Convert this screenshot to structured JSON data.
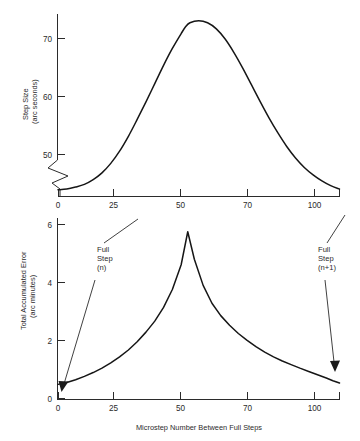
{
  "figure": {
    "background_color": "#ffffff",
    "line_color": "#161616",
    "axis_color": "#2b2b2b"
  },
  "chart_data": [
    {
      "type": "line",
      "id": "step-size-chart",
      "title": "",
      "xlabel": "",
      "ylabel": "Step Size\n(arc seconds)",
      "ylabel_line1": "Step Size",
      "ylabel_line2": "(arc seconds)",
      "xlim": [
        0,
        128
      ],
      "ylim": [
        47.5,
        74.5
      ],
      "grid": false,
      "legend": "none",
      "y_axis_break": true,
      "xticks": [
        0,
        25,
        50,
        75,
        100
      ],
      "xtick_labels": [
        "0",
        "25",
        "50",
        "70",
        "100"
      ],
      "yticks": [
        50,
        60,
        70
      ],
      "ytick_labels": [
        "50",
        "60",
        "70"
      ],
      "x": [
        0,
        4,
        8,
        12,
        16,
        20,
        24,
        28,
        32,
        36,
        40,
        44,
        48,
        52,
        56,
        58,
        60,
        64,
        68,
        72,
        76,
        80,
        84,
        88,
        92,
        96,
        100,
        104,
        108,
        112,
        116,
        120,
        124,
        128
      ],
      "values": [
        48.5,
        48.6,
        48.9,
        49.3,
        50.0,
        51.0,
        52.4,
        54.2,
        56.4,
        58.9,
        61.5,
        64.2,
        66.9,
        69.4,
        71.6,
        72.6,
        73.2,
        73.5,
        73.2,
        72.3,
        70.8,
        68.8,
        66.5,
        64.0,
        61.5,
        59.1,
        56.9,
        54.9,
        53.2,
        51.8,
        50.7,
        49.8,
        49.1,
        48.6
      ],
      "peak_value": 73.5,
      "peak_x": 64,
      "start_value": 48.5,
      "end_value": 48.6
    },
    {
      "type": "line",
      "id": "accumulated-error-chart",
      "title": "",
      "xlabel": "Microstep Number Between Full Steps",
      "ylabel": "Total Accumulated Error\n(arc minutes)",
      "ylabel_line1": "Total Accumulated Error",
      "ylabel_line2": "(arc minutes)",
      "xlim": [
        0,
        128
      ],
      "ylim": [
        0,
        6.6
      ],
      "grid": false,
      "legend": "none",
      "xticks": [
        0,
        25,
        50,
        75,
        100
      ],
      "xtick_labels": [
        "0",
        "25",
        "50",
        "70",
        "100"
      ],
      "yticks": [
        0,
        2,
        4,
        6
      ],
      "ytick_labels": [
        "0",
        "2",
        "4",
        "6"
      ],
      "x": [
        0,
        4,
        8,
        12,
        16,
        20,
        24,
        28,
        32,
        36,
        40,
        44,
        48,
        52,
        56,
        59,
        62,
        66,
        70,
        74,
        78,
        82,
        86,
        90,
        94,
        98,
        102,
        106,
        110,
        114,
        118,
        122,
        125,
        128
      ],
      "values": [
        0.55,
        0.62,
        0.72,
        0.84,
        0.98,
        1.14,
        1.33,
        1.55,
        1.8,
        2.1,
        2.45,
        2.85,
        3.35,
        4.0,
        4.9,
        6.1,
        5.1,
        4.15,
        3.5,
        3.05,
        2.7,
        2.4,
        2.15,
        1.92,
        1.72,
        1.55,
        1.4,
        1.27,
        1.14,
        1.02,
        0.9,
        0.78,
        0.68,
        0.6
      ],
      "peak_value": 6.1,
      "peak_x": 59,
      "start_value": 0.55,
      "end_value": 0.6,
      "annotations": [
        {
          "id": "full-step-n",
          "lines": [
            "Full",
            "Step",
            "(n)"
          ],
          "points_to_x": 2,
          "points_to_y": 0.45
        },
        {
          "id": "full-step-n-plus-1",
          "lines": [
            "Full",
            "Step",
            "(n+1)"
          ],
          "points_to_x": 126,
          "points_to_y": 1.0
        }
      ]
    }
  ]
}
